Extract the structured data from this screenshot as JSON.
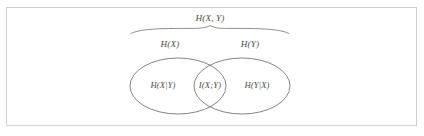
{
  "figure": {
    "kind": "information-theory-venn-diagram",
    "frame": {
      "border_color": "#cfcfcf",
      "background_color": "#ffffff"
    },
    "stroke_color": "#6e6e6e",
    "text_color": "#4a4a4a",
    "labels": {
      "joint_entropy": "H(X, Y)",
      "entropy_x": "H(X)",
      "entropy_y": "H(Y)",
      "conditional_x_given_y": "H(X|Y)",
      "mutual_information": "I(X;Y)",
      "conditional_y_given_x": "H(Y|X)"
    },
    "brace": {
      "label": "H(X, Y)",
      "span_left": 131,
      "span_right": 289,
      "peak_x": 210
    },
    "left_ellipse": {
      "label": "H(X)",
      "center_x": 178,
      "center_y": 86,
      "radius_x": 48,
      "radius_y": 28
    },
    "right_ellipse": {
      "label": "H(Y)",
      "center_x": 242,
      "center_y": 86,
      "radius_x": 48,
      "radius_y": 28
    },
    "intersection": {
      "label": "I(X;Y)",
      "center_x": 210,
      "center_y": 86
    }
  }
}
